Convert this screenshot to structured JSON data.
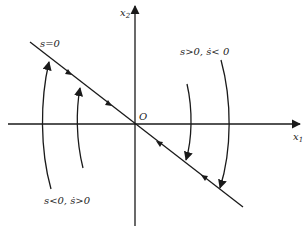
{
  "diagram": {
    "axes": {
      "x_label": "x",
      "x_sub": "1",
      "y_label": "x",
      "y_sub": "2",
      "origin_label": "O"
    },
    "switching_line_label": "s=0",
    "region_upper_label": "s>0, ṡ< 0",
    "region_lower_label": "s<0, ṡ>0",
    "colors": {
      "ink": "#1a1a1a",
      "background": "#ffffff"
    }
  }
}
